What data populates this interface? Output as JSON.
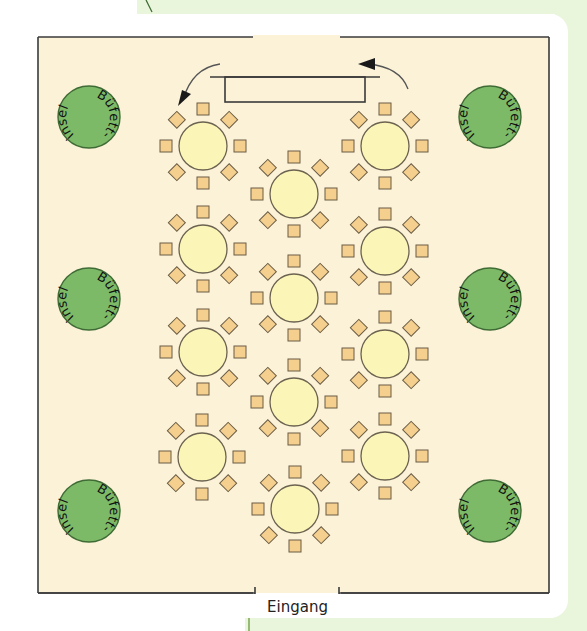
{
  "diagram": {
    "type": "floor-plan",
    "colors": {
      "green_panel": "#e9f6dc",
      "card": "#ffffff",
      "floor": "#fbf2d8",
      "wall": "#3a3a3a",
      "buffet_fill": "#7dba68",
      "buffet_stroke": "#3f6b35",
      "table_fill": "#fbf6b8",
      "table_stroke": "#6b6250",
      "chair_fill": "#f4cf8e",
      "chair_stroke": "#6b5d45",
      "arrow": "#1a1a1a"
    },
    "room": {
      "x": 38,
      "y": 37,
      "w": 511,
      "h": 556,
      "top_gap": [
        253,
        340
      ],
      "bottom_gap": [
        268,
        326
      ]
    },
    "entrance": {
      "label": "Eingang"
    },
    "stage": {
      "top_line": [
        210,
        380,
        77
      ],
      "rect": {
        "x": 225,
        "y": 77,
        "w": 140,
        "h": 25
      }
    },
    "buffet_islands": [
      {
        "cx": 89,
        "cy": 117,
        "label_top": "Büfett-",
        "label_bottom": "insel"
      },
      {
        "cx": 89,
        "cy": 299,
        "label_top": "Büfett-",
        "label_bottom": "insel"
      },
      {
        "cx": 89,
        "cy": 511,
        "label_top": "Büfett-",
        "label_bottom": "insel"
      },
      {
        "cx": 490,
        "cy": 117,
        "label_top": "Büfett-",
        "label_bottom": "insel"
      },
      {
        "cx": 490,
        "cy": 299,
        "label_top": "Büfett-",
        "label_bottom": "insel"
      },
      {
        "cx": 490,
        "cy": 511,
        "label_top": "Büfett-",
        "label_bottom": "insel"
      }
    ],
    "buffet_radius": 31,
    "tables": [
      {
        "cx": 203,
        "cy": 146
      },
      {
        "cx": 203,
        "cy": 249
      },
      {
        "cx": 203,
        "cy": 352
      },
      {
        "cx": 202,
        "cy": 457
      },
      {
        "cx": 294,
        "cy": 194
      },
      {
        "cx": 294,
        "cy": 298
      },
      {
        "cx": 294,
        "cy": 402
      },
      {
        "cx": 295,
        "cy": 509
      },
      {
        "cx": 385,
        "cy": 146
      },
      {
        "cx": 385,
        "cy": 251
      },
      {
        "cx": 385,
        "cy": 354
      },
      {
        "cx": 385,
        "cy": 456
      }
    ],
    "table_radius": 24,
    "chairs_per_table": 8,
    "chair_size": 12,
    "chair_distance": 37,
    "arrows": [
      {
        "name": "left-flow-arrow",
        "path": "M220,64 Q192,68 183,100",
        "head": [
          183,
          104
        ]
      },
      {
        "name": "right-flow-arrow",
        "path": "M408,89 Q400,67 368,64",
        "head": [
          361,
          64
        ]
      }
    ]
  }
}
